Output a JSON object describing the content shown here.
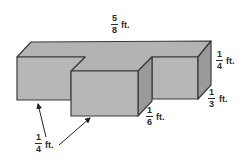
{
  "figure": {
    "type": "3D rectangular prism composite figure",
    "colors": {
      "face_front": "#b7b7b7",
      "face_top": "#b3b3b3",
      "face_side": "#9a9a9a",
      "edge": "#3a3a3a",
      "arrow": "#222222"
    }
  },
  "labels": {
    "top_length": {
      "numerator": "5",
      "denominator": "8",
      "unit": "ft."
    },
    "right_height": {
      "numerator": "1",
      "denominator": "4",
      "unit": "ft."
    },
    "right_depth": {
      "numerator": "1",
      "denominator": "3",
      "unit": "ft."
    },
    "middle_depth": {
      "numerator": "1",
      "denominator": "6",
      "unit": "ft."
    },
    "left_arrows": {
      "numerator": "1",
      "denominator": "4",
      "unit": "ft."
    }
  }
}
